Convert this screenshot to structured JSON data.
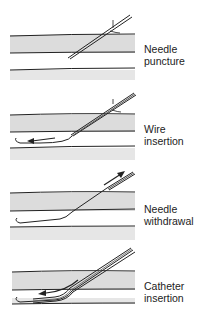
{
  "figure": {
    "steps": [
      {
        "line1": "Needle",
        "line2": "puncture"
      },
      {
        "line1": "Wire",
        "line2": "insertion"
      },
      {
        "line1": "Needle",
        "line2": "withdrawal"
      },
      {
        "line1": "Catheter",
        "line2": "insertion"
      }
    ],
    "caption_fragment": "",
    "colors": {
      "vessel_fill": "#dcdcdc",
      "line": "#222222"
    }
  }
}
